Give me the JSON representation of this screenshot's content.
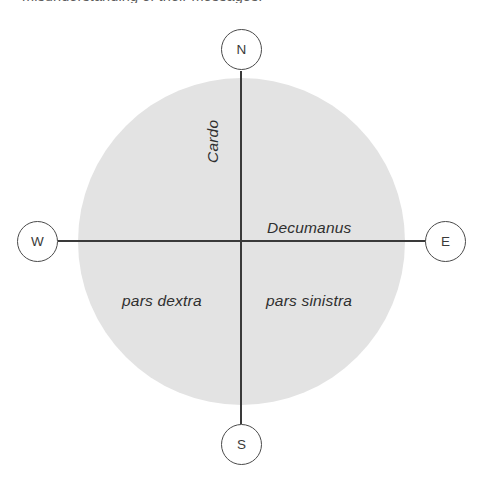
{
  "caption": {
    "clipped_text": "misunderstanding of their messages."
  },
  "diagram": {
    "colors": {
      "disc_fill": "#e3e3e3",
      "axis_stroke": "#3a3a3a",
      "bubble_stroke": "#4a4a4a",
      "bubble_fill": "#ffffff",
      "label_color": "#2f2f2f",
      "background": "#ffffff"
    },
    "compass": [
      {
        "key": "north",
        "label": "N"
      },
      {
        "key": "east",
        "label": "E"
      },
      {
        "key": "south",
        "label": "S"
      },
      {
        "key": "west",
        "label": "W"
      }
    ],
    "axes": [
      {
        "key": "cardo",
        "label": "Cardo",
        "orientation": "vertical",
        "rotation_deg": -90
      },
      {
        "key": "decumanus",
        "label": "Decumanus",
        "orientation": "horizontal",
        "rotation_deg": 0
      }
    ],
    "quadrant_labels": [
      {
        "key": "pars-dextra",
        "label": "pars dextra",
        "side": "west"
      },
      {
        "key": "pars-sinistra",
        "label": "pars sinistra",
        "side": "east"
      }
    ]
  }
}
